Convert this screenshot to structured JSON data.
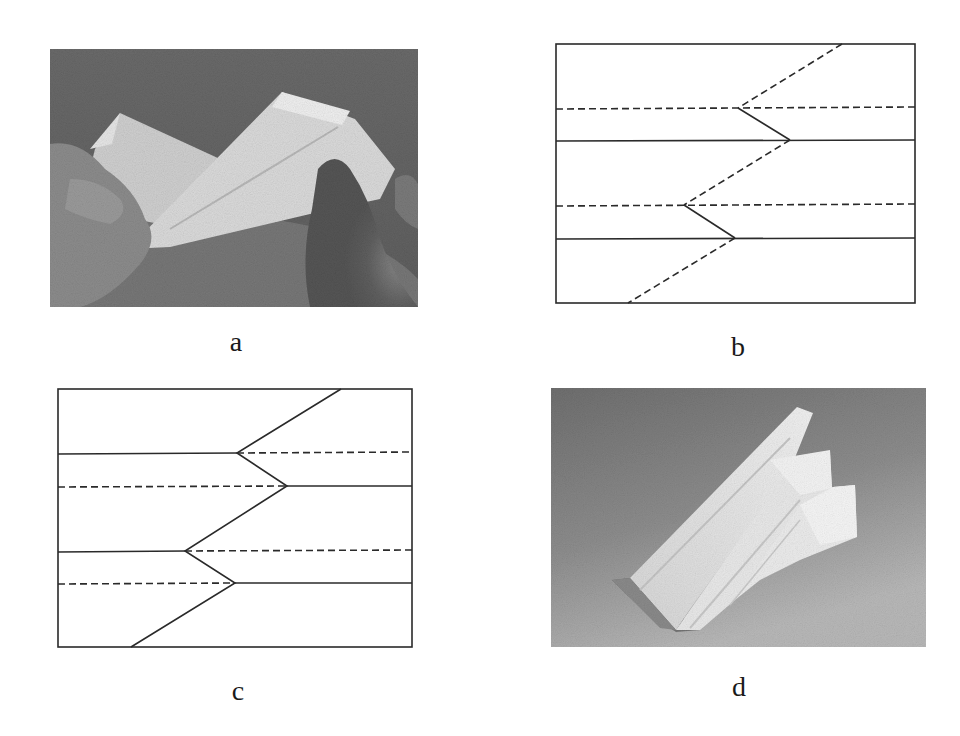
{
  "figure": {
    "panels": [
      {
        "id": "a",
        "label": "a",
        "kind": "photo",
        "description": "Hands folding a long strip of white paper along diagonal creases over a gray background"
      },
      {
        "id": "b",
        "label": "b",
        "kind": "crease-pattern",
        "description": "Rectangle with horizontal fold lines and a zigzag crease; diagonal segments dashed (valley), short segments solid (mountain)"
      },
      {
        "id": "c",
        "label": "c",
        "kind": "crease-pattern",
        "description": "Rectangle with split horizontal fold lines (solid/dashed swap at zigzag vertices) and a fully solid zigzag crease"
      },
      {
        "id": "d",
        "label": "d",
        "kind": "photo",
        "description": "Finished folded white paper structure with stepped wings resting on a gray gradient background"
      }
    ]
  },
  "colors": {
    "line": "#2a2a2a",
    "paper_light": "#e4e4e4",
    "photo_a_bg": "#6d6d6d",
    "photo_d_bg_dark": "#6e6e6e",
    "photo_d_bg_light": "#b4b4b4"
  },
  "crease_patterns": {
    "b": {
      "rect": [
        556,
        44,
        915,
        303
      ],
      "horizontal_lines": [
        {
          "y": 109,
          "style": "dashed"
        },
        {
          "y": 141,
          "style": "solid"
        },
        {
          "y": 205,
          "style": "dashed"
        },
        {
          "y": 238,
          "style": "solid"
        }
      ],
      "zigzag": [
        {
          "from": [
            842,
            44
          ],
          "to": [
            738,
            109
          ],
          "style": "dashed"
        },
        {
          "from": [
            738,
            109
          ],
          "to": [
            790,
            141
          ],
          "style": "solid"
        },
        {
          "from": [
            790,
            141
          ],
          "to": [
            684,
            205
          ],
          "style": "dashed"
        },
        {
          "from": [
            684,
            205
          ],
          "to": [
            735,
            238
          ],
          "style": "solid"
        },
        {
          "from": [
            735,
            238
          ],
          "to": [
            628,
            303
          ],
          "style": "dashed"
        }
      ]
    },
    "c": {
      "rect": [
        58,
        389,
        412,
        647
      ],
      "horizontal_lines": [
        {
          "y": 453,
          "left_style": "solid",
          "right_style": "dashed",
          "split_x": 237
        },
        {
          "y": 486,
          "left_style": "dashed",
          "right_style": "solid",
          "split_x": 287
        },
        {
          "y": 551,
          "left_style": "solid",
          "right_style": "dashed",
          "split_x": 185
        },
        {
          "y": 583,
          "left_style": "dashed",
          "right_style": "solid",
          "split_x": 235
        }
      ],
      "zigzag": [
        {
          "from": [
            341,
            389
          ],
          "to": [
            237,
            453
          ],
          "style": "solid"
        },
        {
          "from": [
            237,
            453
          ],
          "to": [
            287,
            486
          ],
          "style": "solid"
        },
        {
          "from": [
            287,
            486
          ],
          "to": [
            185,
            551
          ],
          "style": "solid"
        },
        {
          "from": [
            185,
            551
          ],
          "to": [
            235,
            583
          ],
          "style": "solid"
        },
        {
          "from": [
            235,
            583
          ],
          "to": [
            131,
            647
          ],
          "style": "solid"
        }
      ]
    }
  }
}
